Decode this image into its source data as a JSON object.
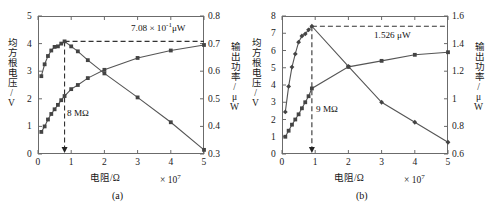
{
  "figure": {
    "panels": [
      {
        "caption": "(a)",
        "x_axis": {
          "label": "电阻/Ω",
          "multiplier_base": "× 10",
          "multiplier_exp": "7",
          "ticks": [
            "0",
            "1",
            "2",
            "3",
            "4",
            "5"
          ],
          "min": 0,
          "max": 5
        },
        "y_left": {
          "label": "均方根电压/V",
          "ticks": [
            "0",
            "1",
            "2",
            "3",
            "4",
            "5"
          ],
          "min": 0,
          "max": 5
        },
        "y_right": {
          "label": "输出功率/μW",
          "ticks": [
            "0.3",
            "0.4",
            "0.5",
            "0.6",
            "0.7",
            "0.8"
          ],
          "min": 0.3,
          "max": 0.8
        },
        "annotations": {
          "peak_power_base": "7.08 × 10",
          "peak_power_exp": "-1",
          "peak_power_unit": "μW",
          "optimal_resistance": "8 MΩ"
        }
      },
      {
        "caption": "(b)",
        "x_axis": {
          "label": "电阻/Ω",
          "multiplier_base": "× 10",
          "multiplier_exp": "7",
          "ticks": [
            "0",
            "1",
            "2",
            "3",
            "4",
            "5"
          ],
          "min": 0,
          "max": 5
        },
        "y_left": {
          "label": "均方根电压/V",
          "ticks": [
            "0",
            "1",
            "2",
            "3",
            "4",
            "5",
            "6",
            "7",
            "8"
          ],
          "min": 0,
          "max": 8
        },
        "y_right": {
          "label": "输出功率/μW",
          "ticks": [
            "0.6",
            "0.8",
            "1",
            "1.2",
            "1.4",
            "1.6"
          ],
          "min": 0.6,
          "max": 1.6
        },
        "annotations": {
          "peak_power": "1.526 μW",
          "optimal_resistance": "9 MΩ"
        }
      }
    ]
  },
  "chart_data": [
    {
      "type": "line",
      "title": "(a)",
      "xlabel": "电阻/Ω (× 10^7)",
      "ylabel": "均方根电压/V",
      "ylabel_right": "输出功率/μW",
      "xlim": [
        0,
        5
      ],
      "ylim": [
        0,
        5
      ],
      "ylim_right": [
        0.3,
        0.8
      ],
      "grid": false,
      "legend": "none",
      "annotations": [
        {
          "text": "7.08 × 10^-1 μW",
          "type": "peak-power-dashed-line",
          "value": 0.708,
          "axis": "right"
        },
        {
          "text": "8 MΩ",
          "type": "optimal-resistance-dashed-line",
          "value": 0.8,
          "axis": "x"
        }
      ],
      "series": [
        {
          "name": "均方根电压",
          "axis": "left",
          "marker": "square",
          "x": [
            0.1,
            0.2,
            0.3,
            0.4,
            0.5,
            0.6,
            0.7,
            0.8,
            1.0,
            1.2,
            1.5,
            2.0,
            3.0,
            4.0,
            5.0
          ],
          "y": [
            0.8,
            1.0,
            1.25,
            1.45,
            1.62,
            1.78,
            1.95,
            2.1,
            2.35,
            2.5,
            2.75,
            3.05,
            3.48,
            3.75,
            3.95
          ]
        },
        {
          "name": "输出功率",
          "axis": "right",
          "marker": "square",
          "x": [
            0.1,
            0.2,
            0.3,
            0.4,
            0.5,
            0.6,
            0.7,
            0.8,
            1.0,
            1.2,
            1.5,
            2.0,
            3.0,
            4.0,
            5.0
          ],
          "y": [
            0.582,
            0.625,
            0.655,
            0.675,
            0.688,
            0.69,
            0.7,
            0.708,
            0.69,
            0.672,
            0.64,
            0.592,
            0.505,
            0.415,
            0.315
          ]
        }
      ]
    },
    {
      "type": "line",
      "title": "(b)",
      "xlabel": "电阻/Ω (× 10^7)",
      "ylabel": "均方根电压/V",
      "ylabel_right": "输出功率/μW",
      "xlim": [
        0,
        5
      ],
      "ylim": [
        0,
        8
      ],
      "ylim_right": [
        0.6,
        1.6
      ],
      "grid": false,
      "legend": "none",
      "annotations": [
        {
          "text": "1.526 μW",
          "type": "peak-power-dashed-line",
          "value": 1.526,
          "axis": "right"
        },
        {
          "text": "9 MΩ",
          "type": "optimal-resistance-dashed-line",
          "value": 0.9,
          "axis": "x"
        }
      ],
      "series": [
        {
          "name": "均方根电压",
          "axis": "left",
          "marker": "square",
          "x": [
            0.1,
            0.2,
            0.3,
            0.4,
            0.5,
            0.6,
            0.7,
            0.8,
            0.9,
            2.0,
            3.0,
            4.0,
            5.0
          ],
          "y": [
            1.0,
            1.35,
            1.7,
            2.0,
            2.3,
            2.65,
            3.0,
            3.35,
            3.8,
            5.05,
            5.4,
            5.75,
            5.9
          ]
        },
        {
          "name": "输出功率",
          "axis": "right",
          "marker": "diamond",
          "x": [
            0.1,
            0.2,
            0.3,
            0.4,
            0.5,
            0.6,
            0.7,
            0.8,
            0.9,
            2.0,
            3.0,
            4.0,
            5.0
          ],
          "y": [
            0.905,
            1.09,
            1.23,
            1.325,
            1.41,
            1.455,
            1.47,
            1.5,
            1.526,
            1.235,
            0.975,
            0.83,
            0.685
          ]
        }
      ]
    }
  ]
}
